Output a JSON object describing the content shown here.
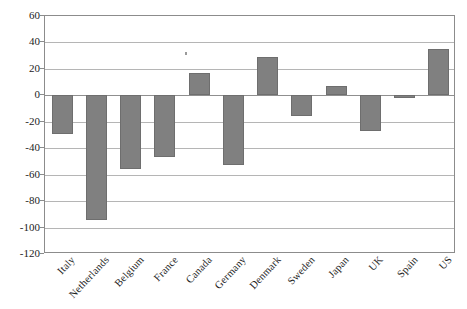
{
  "chart_data": {
    "type": "bar",
    "title": "",
    "subtitle": "",
    "xlabel": "",
    "ylabel": "",
    "categories": [
      "Italy",
      "Netherlands",
      "Belgium",
      "France",
      "Canada",
      "Germany",
      "Denmark",
      "Sweden",
      "Japan",
      "UK",
      "Spain",
      "US"
    ],
    "values": [
      -29,
      -94,
      -56,
      -47,
      17,
      -53,
      29,
      -16,
      7,
      -27,
      -2,
      35
    ],
    "series": [
      {
        "name": "",
        "values": [
          -29,
          -94,
          -56,
          -47,
          17,
          -53,
          29,
          -16,
          7,
          -27,
          -2,
          35
        ]
      }
    ],
    "ylim": [
      -120,
      60
    ],
    "ytick_labels": [
      "60",
      "40",
      "20",
      "0",
      "-20",
      "-40",
      "-60",
      "-80",
      "-100",
      "-120"
    ],
    "ytick_values": [
      60,
      40,
      20,
      0,
      -20,
      -40,
      -60,
      -80,
      -100,
      -120
    ],
    "grid": true,
    "legend": false,
    "legend_position": "none",
    "bar_color": "#808080",
    "bar_edge_color": "#6e6e6e",
    "grid_color": "#b5b5b5",
    "frame_color": "#8c8c8c",
    "zero_line_value": 0
  }
}
